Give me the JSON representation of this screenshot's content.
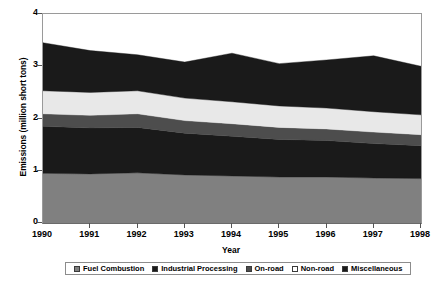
{
  "chart_data": {
    "type": "area",
    "title": "",
    "xlabel": "Year",
    "ylabel": "Emissions (million short tons)",
    "stacked": true,
    "grid": false,
    "legend_position": "bottom",
    "categories": [
      "1990",
      "1991",
      "1992",
      "1993",
      "1994",
      "1995",
      "1996",
      "1997",
      "1998"
    ],
    "x": [
      1990,
      1991,
      1992,
      1993,
      1994,
      1995,
      1996,
      1997,
      1998
    ],
    "xlim": [
      1990,
      1998
    ],
    "ylim": [
      0,
      4
    ],
    "yticks": [
      "0",
      "1",
      "2",
      "3",
      "4"
    ],
    "ytick_values": [
      0,
      1,
      2,
      3,
      4
    ],
    "series": [
      {
        "name": "Fuel Combustion",
        "color": "#808080",
        "values": [
          0.95,
          0.94,
          0.96,
          0.92,
          0.9,
          0.88,
          0.88,
          0.86,
          0.85
        ]
      },
      {
        "name": "Industrial Processing",
        "color": "#1a1a1a",
        "values": [
          0.9,
          0.88,
          0.87,
          0.8,
          0.76,
          0.72,
          0.7,
          0.66,
          0.63
        ]
      },
      {
        "name": "On-road",
        "color": "#4d4d4d",
        "values": [
          0.24,
          0.24,
          0.26,
          0.24,
          0.24,
          0.23,
          0.22,
          0.22,
          0.21
        ]
      },
      {
        "name": "Non-road",
        "color": "#e8e8e8",
        "values": [
          0.44,
          0.44,
          0.44,
          0.43,
          0.42,
          0.41,
          0.4,
          0.39,
          0.38
        ]
      },
      {
        "name": "Miscellaneous",
        "color": "#1a1a1a",
        "values": [
          0.92,
          0.8,
          0.69,
          0.69,
          0.93,
          0.81,
          0.92,
          1.07,
          0.93
        ]
      }
    ],
    "totals": [
      3.45,
      3.3,
      3.22,
      3.08,
      3.25,
      3.05,
      3.12,
      3.2,
      3.0
    ]
  },
  "legend": {
    "items": [
      {
        "label": "Fuel Combustion",
        "color": "#808080"
      },
      {
        "label": "Industrial Processing",
        "color": "#1a1a1a"
      },
      {
        "label": "On-road",
        "color": "#4d4d4d"
      },
      {
        "label": "Non-road",
        "color": "#ffffff"
      },
      {
        "label": "Miscellaneous",
        "color": "#1a1a1a"
      }
    ]
  }
}
